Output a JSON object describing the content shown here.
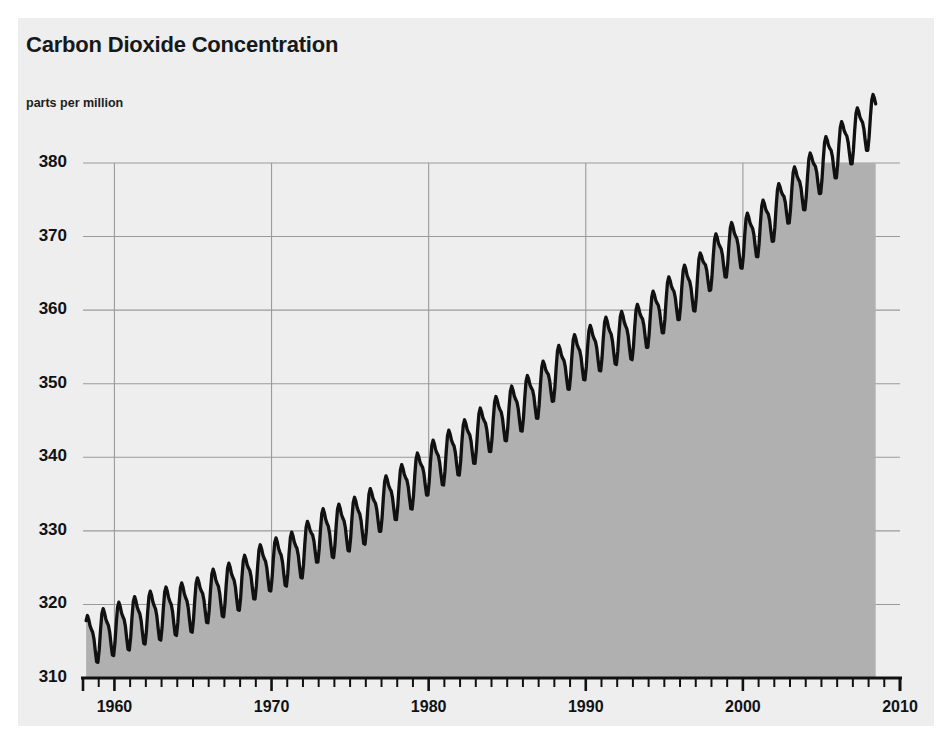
{
  "title": "Carbon Dioxide Concentration",
  "subtitle": "parts per million",
  "colors": {
    "page_background": "#ffffff",
    "card_background": "#eeeeee",
    "area_fill": "#b0b0b0",
    "line": "#111111",
    "gridline": "#9a9a9a",
    "axis": "#111111",
    "text": "#101214"
  },
  "chart_data": {
    "type": "area",
    "title": "Carbon Dioxide Concentration",
    "subtitle": "parts per million",
    "xlabel": "",
    "ylabel": "parts per million",
    "xlim": [
      1958,
      2010
    ],
    "ylim": [
      310,
      380
    ],
    "y_ticks": [
      310,
      320,
      330,
      340,
      350,
      360,
      370,
      380
    ],
    "y_tick_labels": [
      "310",
      "320",
      "330",
      "340",
      "350",
      "360",
      "370",
      "380"
    ],
    "x_ticks": [
      1960,
      1970,
      1980,
      1990,
      2000,
      2010
    ],
    "x_tick_labels": [
      "1960",
      "1970",
      "1980",
      "1990",
      "2000",
      "2010"
    ],
    "x_minor_tick_interval": 1,
    "grid": "both",
    "legend": "none",
    "fill_clipped_at": 380,
    "annotations": [],
    "series": [
      {
        "name": "Atmospheric CO2 (Mauna Loa)",
        "description": "Monthly mean CO2 concentration with seasonal oscillation, rising trend 1958-2008",
        "seasonal_amplitude_ppm": 6.2,
        "x": [
          1958.5,
          1959,
          1959.5,
          1960,
          1960.5,
          1961,
          1961.5,
          1962,
          1962.5,
          1963,
          1963.5,
          1964,
          1964.5,
          1965,
          1965.5,
          1966,
          1966.5,
          1967,
          1967.5,
          1968,
          1968.5,
          1969,
          1969.5,
          1970,
          1970.5,
          1971,
          1971.5,
          1972,
          1972.5,
          1973,
          1973.5,
          1974,
          1974.5,
          1975,
          1975.5,
          1976,
          1976.5,
          1977,
          1977.5,
          1978,
          1978.5,
          1979,
          1979.5,
          1980,
          1980.5,
          1981,
          1981.5,
          1982,
          1982.5,
          1983,
          1983.5,
          1984,
          1984.5,
          1985,
          1985.5,
          1986,
          1986.5,
          1987,
          1987.5,
          1988,
          1988.5,
          1989,
          1989.5,
          1990,
          1990.5,
          1991,
          1991.5,
          1992,
          1992.5,
          1993,
          1993.5,
          1994,
          1994.5,
          1995,
          1995.5,
          1996,
          1996.5,
          1997,
          1997.5,
          1998,
          1998.5,
          1999,
          1999.5,
          2000,
          2000.5,
          2001,
          2001.5,
          2002,
          2002.5,
          2003,
          2003.5,
          2004,
          2004.5,
          2005,
          2005.5,
          2006,
          2006.5,
          2007,
          2007.5,
          2008
        ],
        "annual_means": [
          {
            "year": 1959,
            "value": 315.97
          },
          {
            "year": 1960,
            "value": 316.91
          },
          {
            "year": 1961,
            "value": 317.64
          },
          {
            "year": 1962,
            "value": 318.45
          },
          {
            "year": 1963,
            "value": 318.99
          },
          {
            "year": 1964,
            "value": 319.62
          },
          {
            "year": 1965,
            "value": 320.04
          },
          {
            "year": 1966,
            "value": 321.38
          },
          {
            "year": 1967,
            "value": 322.16
          },
          {
            "year": 1968,
            "value": 323.04
          },
          {
            "year": 1969,
            "value": 324.62
          },
          {
            "year": 1970,
            "value": 325.68
          },
          {
            "year": 1971,
            "value": 326.32
          },
          {
            "year": 1972,
            "value": 327.45
          },
          {
            "year": 1973,
            "value": 329.68
          },
          {
            "year": 1974,
            "value": 330.18
          },
          {
            "year": 1975,
            "value": 331.11
          },
          {
            "year": 1976,
            "value": 332.04
          },
          {
            "year": 1977,
            "value": 333.83
          },
          {
            "year": 1978,
            "value": 335.4
          },
          {
            "year": 1979,
            "value": 336.84
          },
          {
            "year": 1980,
            "value": 338.75
          },
          {
            "year": 1981,
            "value": 340.11
          },
          {
            "year": 1982,
            "value": 341.45
          },
          {
            "year": 1983,
            "value": 343.05
          },
          {
            "year": 1984,
            "value": 344.65
          },
          {
            "year": 1985,
            "value": 346.12
          },
          {
            "year": 1986,
            "value": 347.42
          },
          {
            "year": 1987,
            "value": 349.19
          },
          {
            "year": 1988,
            "value": 351.57
          },
          {
            "year": 1989,
            "value": 353.12
          },
          {
            "year": 1990,
            "value": 354.39
          },
          {
            "year": 1991,
            "value": 355.61
          },
          {
            "year": 1992,
            "value": 356.45
          },
          {
            "year": 1993,
            "value": 357.1
          },
          {
            "year": 1994,
            "value": 358.83
          },
          {
            "year": 1995,
            "value": 360.82
          },
          {
            "year": 1996,
            "value": 362.61
          },
          {
            "year": 1997,
            "value": 363.73
          },
          {
            "year": 1998,
            "value": 366.7
          },
          {
            "year": 1999,
            "value": 368.38
          },
          {
            "year": 2000,
            "value": 369.55
          },
          {
            "year": 2001,
            "value": 371.14
          },
          {
            "year": 2002,
            "value": 373.28
          },
          {
            "year": 2003,
            "value": 375.8
          },
          {
            "year": 2004,
            "value": 377.52
          },
          {
            "year": 2005,
            "value": 379.8
          },
          {
            "year": 2006,
            "value": 381.9
          },
          {
            "year": 2007,
            "value": 383.79
          },
          {
            "year": 2008,
            "value": 385.6
          }
        ]
      }
    ]
  }
}
